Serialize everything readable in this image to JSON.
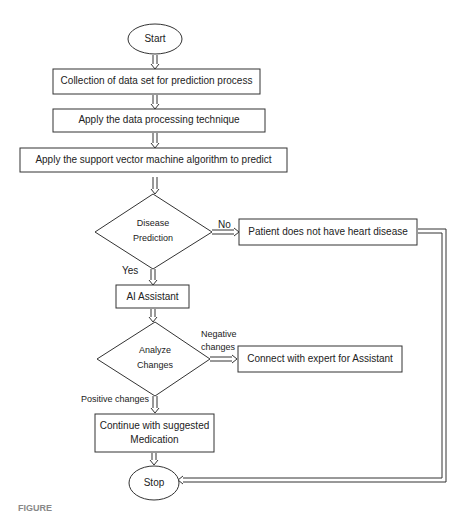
{
  "flowchart": {
    "start": {
      "label": "Start"
    },
    "steps": [
      {
        "id": "collect",
        "label": "Collection of data set for prediction process"
      },
      {
        "id": "process",
        "label": "Apply the data processing technique"
      },
      {
        "id": "svm",
        "label": "Apply the support vector machine algorithm to predict"
      }
    ],
    "decision1": {
      "label_line1": "Disease",
      "label_line2": "Prediction",
      "no_label": "No",
      "yes_label": "Yes",
      "no_outcome": "Patient does not have heart disease"
    },
    "ai_assistant": {
      "label": "AI Assistant"
    },
    "decision2": {
      "label_line1": "Analyze",
      "label_line2": "Changes",
      "negative_label_line1": "Negative",
      "negative_label_line2": "changes",
      "positive_label": "Positive changes",
      "negative_outcome": "Connect with expert for Assistant"
    },
    "continue": {
      "label_line1": "Continue with suggested",
      "label_line2": "Medication"
    },
    "stop": {
      "label": "Stop"
    }
  },
  "caption": "FIGURE"
}
